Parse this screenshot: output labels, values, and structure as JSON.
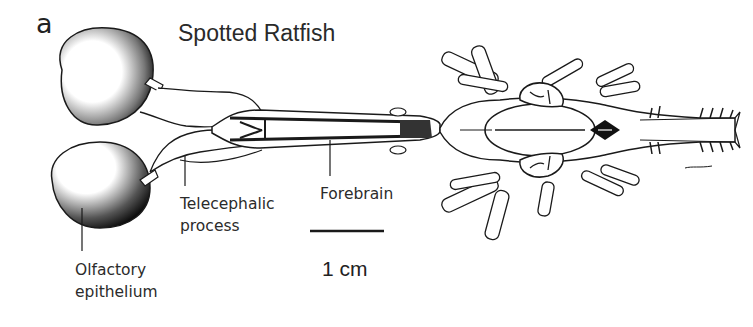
{
  "figure": {
    "panel_letter": "a",
    "title": "Spotted Ratfish",
    "labels": {
      "telecephalic_process": [
        "Telecephalic",
        "process"
      ],
      "forebrain": "Forebrain",
      "olfactory_epithelium": [
        "Olfactory",
        "epithelium"
      ]
    },
    "scale_bar": {
      "label": "1 cm"
    },
    "signature": "Lowe"
  },
  "colors": {
    "ink": "#1a1a1a",
    "background": "#ffffff",
    "text": "#2b2b2b"
  }
}
